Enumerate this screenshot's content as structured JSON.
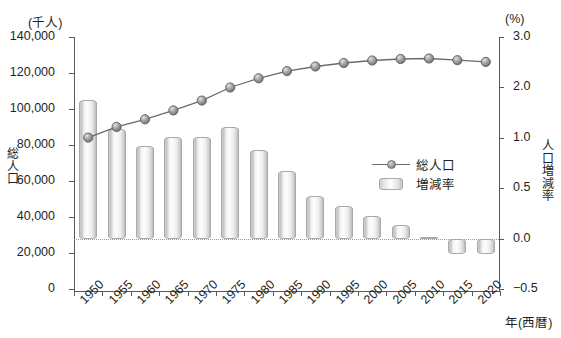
{
  "chart_data": {
    "type": "bar",
    "title": "",
    "xlabel": "年(西暦)",
    "categories": [
      "1950",
      "1955",
      "1960",
      "1965",
      "1970",
      "1975",
      "1980",
      "1985",
      "1990",
      "1995",
      "2000",
      "2005",
      "2010",
      "2015",
      "2020"
    ],
    "left_axis": {
      "unit": "(千人)",
      "title": "総人口",
      "ticks": [
        "140,000",
        "120,000",
        "100,000",
        "80,000",
        "60,000",
        "40,000",
        "20,000",
        "0"
      ],
      "tick_values": [
        140000,
        120000,
        100000,
        80000,
        60000,
        40000,
        20000,
        0
      ],
      "ylim": [
        0,
        140000
      ]
    },
    "right_axis": {
      "unit": "(%)",
      "title": "人口増減率",
      "ticks": [
        "3.0",
        "2.0",
        "1.0",
        "0.5",
        "0.0",
        "-0.5"
      ],
      "tick_values": [
        3.0,
        2.0,
        1.0,
        0.5,
        0.0,
        -0.5
      ],
      "ylim": [
        -0.5,
        3.0
      ]
    },
    "grid": false,
    "legend_position": "inside-right",
    "series": [
      {
        "name": "総人口",
        "kind": "line",
        "axis": "left",
        "unit": "千人",
        "values": [
          84115,
          90077,
          94302,
          99209,
          104665,
          111940,
          117060,
          121049,
          123611,
          125570,
          126926,
          127768,
          128057,
          127095,
          126146
        ]
      },
      {
        "name": "増減率",
        "kind": "bar",
        "axis": "right",
        "unit": "%",
        "values": [
          1.75,
          1.17,
          0.92,
          1.02,
          1.02,
          1.22,
          0.88,
          0.67,
          0.42,
          0.32,
          0.22,
          0.13,
          0.02,
          -0.15,
          -0.15
        ]
      }
    ]
  },
  "legend": {
    "items": [
      {
        "label": "総人口",
        "key": "line-marker"
      },
      {
        "label": "増減率",
        "key": "bar-swatch"
      }
    ]
  }
}
